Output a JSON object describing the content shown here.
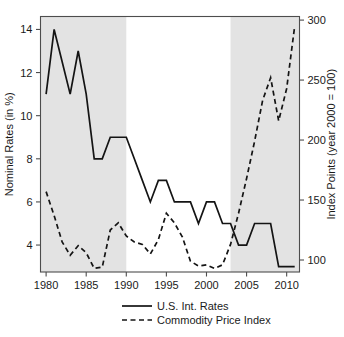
{
  "chart_data": {
    "type": "line",
    "title": "",
    "subtitle": "",
    "xlabel": "",
    "ylabel": "Nominal Rates (in %)",
    "y2label": "Index Points (year 2000 = 100)",
    "grid": false,
    "legend_position": "bottom",
    "xlim": [
      1979.3,
      2011.6
    ],
    "ylim": [
      2.75,
      14.6
    ],
    "y2lim": [
      90.0,
      303.0
    ],
    "xticks": [
      1980,
      1985,
      1990,
      1995,
      2000,
      2005,
      2010
    ],
    "xtick_labels": [
      "1980",
      "1985",
      "1990",
      "1995",
      "2000",
      "2005",
      "2010"
    ],
    "yticks": [
      4,
      6,
      8,
      10,
      12,
      14
    ],
    "ytick_labels": [
      "4",
      "6",
      "8",
      "10",
      "12",
      "14"
    ],
    "y2ticks": [
      100,
      150,
      200,
      250,
      300
    ],
    "y2tick_labels": [
      "100",
      "150",
      "200",
      "250",
      "300"
    ],
    "shaded_bands": [
      {
        "x0": 1979.3,
        "x1": 1990.0,
        "color": "#e3e3e3"
      },
      {
        "x0": 2003.0,
        "x1": 2011.6,
        "color": "#e3e3e3"
      }
    ],
    "x": [
      1980,
      1981,
      1982,
      1983,
      1984,
      1985,
      1986,
      1987,
      1988,
      1989,
      1990,
      1991,
      1992,
      1993,
      1994,
      1995,
      1996,
      1997,
      1998,
      1999,
      2000,
      2001,
      2002,
      2003,
      2004,
      2005,
      2006,
      2007,
      2008,
      2009,
      2010,
      2011
    ],
    "series": [
      {
        "name": "U.S. Int. Rates",
        "axis": "left",
        "style": "solid",
        "color": "#141414",
        "values": [
          11,
          14,
          12.5,
          11,
          13,
          11,
          8,
          8,
          9,
          9,
          9,
          8,
          7,
          6,
          7,
          7,
          6,
          6,
          6,
          5,
          6,
          6,
          5,
          5,
          4,
          4,
          5,
          5,
          5,
          3,
          3,
          3
        ]
      },
      {
        "name": "Commodity Price Index",
        "axis": "right",
        "style": "dashed",
        "color": "#141414",
        "values_left_scale": [
          6.4,
          5.6,
          4.7,
          3.7,
          4.1,
          3.8,
          3.0,
          3.1,
          4.7,
          5.0,
          4.5,
          4.25,
          4.15,
          3.8,
          4.3,
          5.3,
          5.0,
          4.4,
          3.4,
          3.2,
          3.3,
          3.1,
          3.3,
          4.1,
          5.3,
          6.8,
          8.4,
          10.4,
          11.75,
          10.2,
          11.3,
          13.9
        ],
        "values": [
          157,
          137,
          115,
          104,
          112,
          106,
          93,
          94,
          125,
          131,
          120,
          115,
          113,
          105,
          117,
          139,
          131,
          119,
          99,
          95,
          96,
          93,
          96,
          113,
          139,
          168,
          199,
          233,
          252,
          216,
          243,
          295
        ]
      }
    ],
    "annotations": []
  },
  "legend": {
    "entries": [
      {
        "label": "U.S. Int. Rates",
        "style": "solid"
      },
      {
        "label": "Commodity Price Index",
        "style": "dashed"
      }
    ]
  }
}
